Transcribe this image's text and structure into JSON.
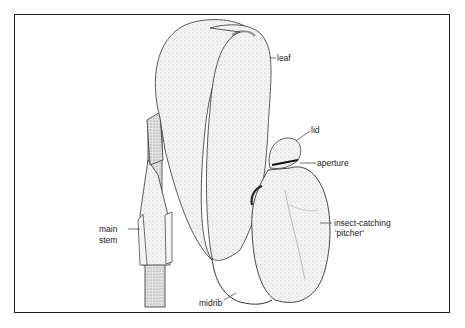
{
  "figure": {
    "labels": {
      "leaf": "leaf",
      "lid": "lid",
      "aperture": "aperture",
      "pitcher_line1": "insect-catching",
      "pitcher_line2": "'pitcher'",
      "stem_line1": "main",
      "stem_line2": "stem",
      "midrib": "midrib"
    }
  },
  "colors": {
    "line": "#222222",
    "fill": "#f2f2f2",
    "shade": "#cfcfcf"
  }
}
